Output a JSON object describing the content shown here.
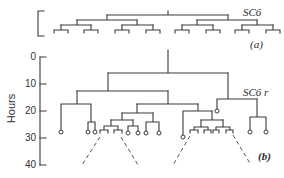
{
  "figure": {
    "panel_a": {
      "label": "(a)",
      "tree_label": "SC6"
    },
    "panel_b": {
      "label": "(b)",
      "tree_label": "SC6 r",
      "y_axis": {
        "title": "Hours",
        "ticks": [
          "0",
          "10",
          "20",
          "30",
          "40"
        ],
        "range": [
          0,
          40
        ]
      }
    }
  },
  "colors": {
    "line": "#3a3a3a",
    "background": "#ffffff"
  }
}
